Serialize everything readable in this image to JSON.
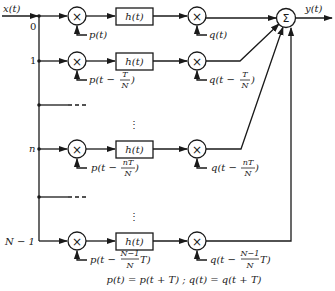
{
  "diagram": {
    "input_label": "x(t)",
    "output_label": "y(t)",
    "sum_symbol": "Σ",
    "multiply_symbol": "×",
    "filter_label": "h(t)",
    "vdots": "⋮",
    "branches": [
      {
        "index_label": "0",
        "p_prefix": "p(t)",
        "p_num": "",
        "p_den": "",
        "p_suffix": "",
        "q_prefix": "q(t)",
        "q_num": "",
        "q_den": "",
        "q_suffix": ""
      },
      {
        "index_label": "1",
        "p_prefix": "p(t −",
        "p_num": "T",
        "p_den": "N",
        "p_suffix": ")",
        "q_prefix": "q(t −",
        "q_num": "T",
        "q_den": "N",
        "q_suffix": ")"
      },
      {
        "index_label": "n",
        "p_prefix": "p(t −",
        "p_num": "nT",
        "p_den": "N",
        "p_suffix": ")",
        "q_prefix": "q(t −",
        "q_num": "nT",
        "q_den": "N",
        "q_suffix": ")"
      },
      {
        "index_label": "N − 1",
        "p_prefix": "p(t −",
        "p_num": "N−1",
        "p_den": "N",
        "p_suffix": "T)",
        "q_prefix": "q(t −",
        "q_num": "N−1",
        "q_den": "N",
        "q_suffix": "T)"
      }
    ],
    "footnote": "p(t) = p(t + T) ; q(t) = q(t + T)"
  }
}
